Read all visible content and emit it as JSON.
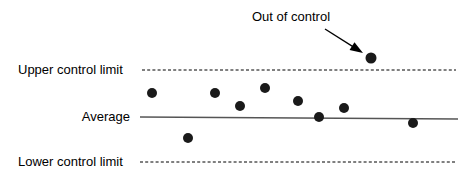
{
  "chart_data": {
    "type": "scatter",
    "title": "",
    "subtitle": "",
    "xlabel": "",
    "ylabel": "",
    "grid": false,
    "legend_position": "none",
    "xlim": [
      0,
      468
    ],
    "ylim": [
      180,
      0
    ],
    "series": [
      {
        "name": "Measurements",
        "marker": "filled-circle",
        "color": "#1a1a1a",
        "points": [
          {
            "x": 152,
            "y": 93,
            "status": "in-control"
          },
          {
            "x": 188,
            "y": 138,
            "status": "in-control"
          },
          {
            "x": 215,
            "y": 93,
            "status": "in-control"
          },
          {
            "x": 240,
            "y": 106,
            "status": "in-control"
          },
          {
            "x": 265,
            "y": 88,
            "status": "in-control"
          },
          {
            "x": 298,
            "y": 101,
            "status": "in-control"
          },
          {
            "x": 319,
            "y": 117,
            "status": "in-control"
          },
          {
            "x": 344,
            "y": 108,
            "status": "in-control"
          },
          {
            "x": 371,
            "y": 58,
            "status": "out-of-control"
          },
          {
            "x": 413,
            "y": 123,
            "status": "in-control"
          }
        ]
      }
    ],
    "reference_lines": [
      {
        "id": "upper_control_limit",
        "label": "Upper control limit",
        "y": 70,
        "x_start": 142,
        "x_end": 456,
        "style": "dashed",
        "color": "#000000"
      },
      {
        "id": "average",
        "label": "Average",
        "y_left": 117,
        "y_right": 119,
        "x_start": 140,
        "x_end": 458,
        "style": "solid",
        "color": "#555555"
      },
      {
        "id": "lower_control_limit",
        "label": "Lower control limit",
        "y": 162,
        "x_start": 140,
        "x_end": 456,
        "style": "dashed",
        "color": "#000000"
      }
    ],
    "annotations": [
      {
        "id": "out_of_control",
        "text": "Out of control",
        "text_x": 252,
        "text_y": 10,
        "arrow_from": {
          "x": 325,
          "y": 29
        },
        "arrow_to": {
          "x": 363,
          "y": 53
        },
        "target_point": {
          "x": 371,
          "y": 58
        },
        "color": "#000000"
      }
    ]
  },
  "labels": {
    "upper_control_limit": "Upper control limit",
    "average": "Average",
    "lower_control_limit": "Lower control limit",
    "out_of_control": "Out of control"
  },
  "colors": {
    "background": "#ffffff",
    "point": "#1a1a1a",
    "limit_line": "#000000",
    "average_line": "#555555",
    "text": "#000000"
  }
}
